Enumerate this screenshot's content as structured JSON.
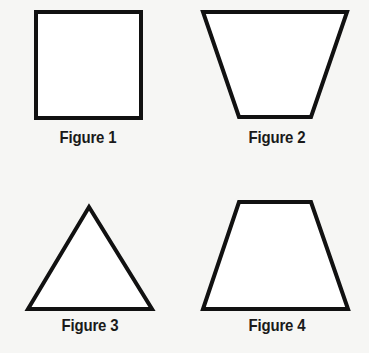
{
  "figures": [
    {
      "label": "Figure 1",
      "shape": "square",
      "points": [
        [
          36,
          12
        ],
        [
          141,
          12
        ],
        [
          141,
          118
        ],
        [
          36,
          118
        ]
      ],
      "label_pos": [
        88,
        128
      ]
    },
    {
      "label": "Figure 2",
      "shape": "trapezoid-inverted",
      "points": [
        [
          203,
          12
        ],
        [
          347,
          12
        ],
        [
          311,
          117
        ],
        [
          239,
          117
        ]
      ],
      "label_pos": [
        277,
        128
      ]
    },
    {
      "label": "Figure 3",
      "shape": "triangle",
      "points": [
        [
          89,
          207
        ],
        [
          152,
          309
        ],
        [
          28,
          309
        ]
      ],
      "label_pos": [
        90,
        316
      ]
    },
    {
      "label": "Figure 4",
      "shape": "trapezoid",
      "points": [
        [
          239,
          202
        ],
        [
          311,
          202
        ],
        [
          348,
          309
        ],
        [
          203,
          309
        ]
      ],
      "label_pos": [
        277,
        316
      ]
    }
  ],
  "style": {
    "stroke": "#111111",
    "stroke_width": 4,
    "fill": "#ffffff"
  }
}
